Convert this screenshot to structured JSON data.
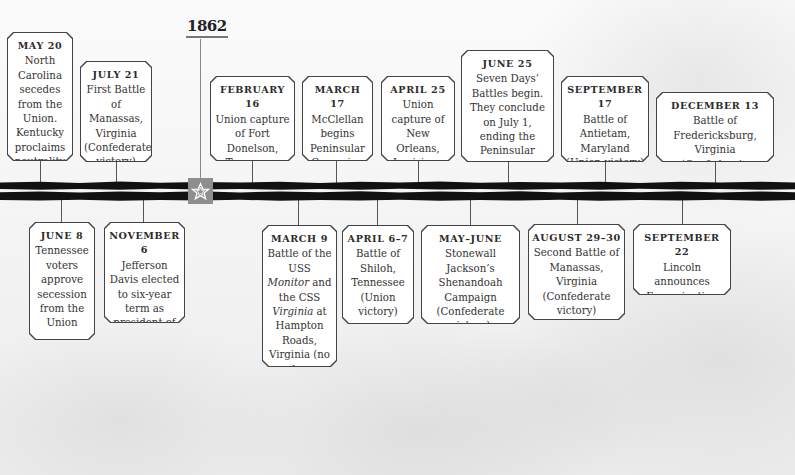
{
  "year": "1862",
  "marker": {
    "icon": "star-icon",
    "color": "#8e8e8e"
  },
  "colors": {
    "bar": "#111111",
    "box_border": "#444444",
    "box_fill": "#ffffff",
    "connector": "#555555"
  },
  "events_above": [
    {
      "date": "MAY 20",
      "desc": "North Carolina secedes from the Union. Kentucky proclaims neutrality"
    },
    {
      "date": "JULY 21",
      "desc": "First Battle of Manassas, Virginia (Confederate victory)"
    },
    {
      "date": "FEBRUARY 16",
      "desc": "Union capture of Fort Donelson, Tennessee"
    },
    {
      "date": "MARCH 17",
      "desc": "McClellan begins Peninsular Campaign"
    },
    {
      "date": "APRIL 25",
      "desc": "Union capture of New Orleans, Louisiana"
    },
    {
      "date": "JUNE 25",
      "desc": "Seven Days’ Battles begin. They conclude on July 1, ending the Peninsular Campaign"
    },
    {
      "date": "SEPTEMBER 17",
      "desc": "Battle of Antietam, Maryland (Union victory)"
    },
    {
      "date": "DECEMBER 13",
      "desc": "Battle of Fredericksburg, Virginia (Confederate victory)"
    }
  ],
  "events_below": [
    {
      "date": "JUNE 8",
      "desc": "Tennessee voters approve secession from the Union"
    },
    {
      "date": "NOVEMBER 6",
      "desc": "Jefferson Davis elected to six-year term as president of the Confederacy"
    },
    {
      "date": "MARCH 9",
      "desc_parts": [
        "Battle of the USS ",
        "Monitor",
        " and the CSS ",
        "Virginia",
        " at Hampton Roads, Virginia (no clear victory)"
      ]
    },
    {
      "date": "APRIL 6–7",
      "desc": "Battle of Shiloh, Tennessee (Union victory)"
    },
    {
      "date": "MAY–JUNE",
      "desc": "Stonewall Jackson’s Shenandoah Campaign (Confederate victory)"
    },
    {
      "date": "AUGUST 29–30",
      "desc": "Second Battle of Manassas, Virginia (Confederate victory)"
    },
    {
      "date": "SEPTEMBER 22",
      "desc": "Lincoln announces Emancipation Proclamation"
    }
  ]
}
